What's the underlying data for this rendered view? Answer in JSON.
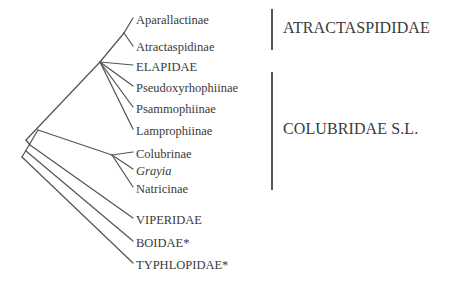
{
  "figure": {
    "type": "phylogenetic-cladogram",
    "line_color": "#555555",
    "text_color": "#3a3a3a",
    "background": "#ffffff"
  },
  "tips": [
    {
      "label": "Aparallactinae",
      "x": 136,
      "y": 21
    },
    {
      "label": "Atractaspidinae",
      "x": 136,
      "y": 48
    },
    {
      "label": "ELAPIDAE",
      "x": 136,
      "y": 68
    },
    {
      "label": "Pseudoxyrhophiinae",
      "x": 136,
      "y": 89
    },
    {
      "label": "Psammophiinae",
      "x": 136,
      "y": 110
    },
    {
      "label": "Lamprophiinae",
      "x": 136,
      "y": 132
    },
    {
      "label": "Colubrinae",
      "x": 136,
      "y": 155
    },
    {
      "label": "Grayia",
      "x": 136,
      "y": 172,
      "italic": true
    },
    {
      "label": "Natricinae",
      "x": 136,
      "y": 190
    },
    {
      "label": "VIPERIDAE",
      "x": 136,
      "y": 221
    },
    {
      "label": "BOIDAE*",
      "x": 136,
      "y": 244
    },
    {
      "label": "TYPHLOPIDAE*",
      "x": 136,
      "y": 266
    }
  ],
  "clade_brackets": [
    {
      "label": "ATRACTASPIDIDAE",
      "bracket_x": 272,
      "bracket_y1": 9,
      "bracket_y2": 50,
      "label_x": 283,
      "label_y": 28
    },
    {
      "label": "COLUBRIDAE S.L.",
      "bracket_x": 272,
      "bracket_y1": 72,
      "bracket_y2": 190,
      "label_x": 283,
      "label_y": 129
    }
  ],
  "branches": {
    "root_x": 26,
    "root_y": 140,
    "polytomy_node_x": 100,
    "polytomy_node_y": 62,
    "atractaspid_node_x": 124,
    "atractaspid_node_y": 33,
    "colubrine_node_x": 112,
    "colubrine_node_y": 155
  }
}
